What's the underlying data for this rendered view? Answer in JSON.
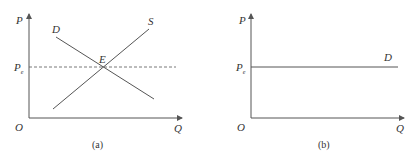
{
  "panels": [
    {
      "id": "a",
      "caption": "(a)",
      "axis_y_label": "P",
      "axis_x_label": "Q",
      "origin_label": "O",
      "price_label_main": "P",
      "price_label_sub": "e",
      "curves": [
        {
          "label": "D",
          "type": "demand",
          "slope": "downward"
        },
        {
          "label": "S",
          "type": "supply",
          "slope": "upward"
        }
      ],
      "equilibrium_label": "E",
      "equilibrium_line": "dashed"
    },
    {
      "id": "b",
      "caption": "(b)",
      "axis_y_label": "P",
      "axis_x_label": "Q",
      "origin_label": "O",
      "price_label_main": "P",
      "price_label_sub": "e",
      "curves": [
        {
          "label": "D",
          "type": "demand",
          "slope": "horizontal"
        }
      ]
    }
  ],
  "colors": {
    "line": "#555555",
    "text": "#333333"
  }
}
